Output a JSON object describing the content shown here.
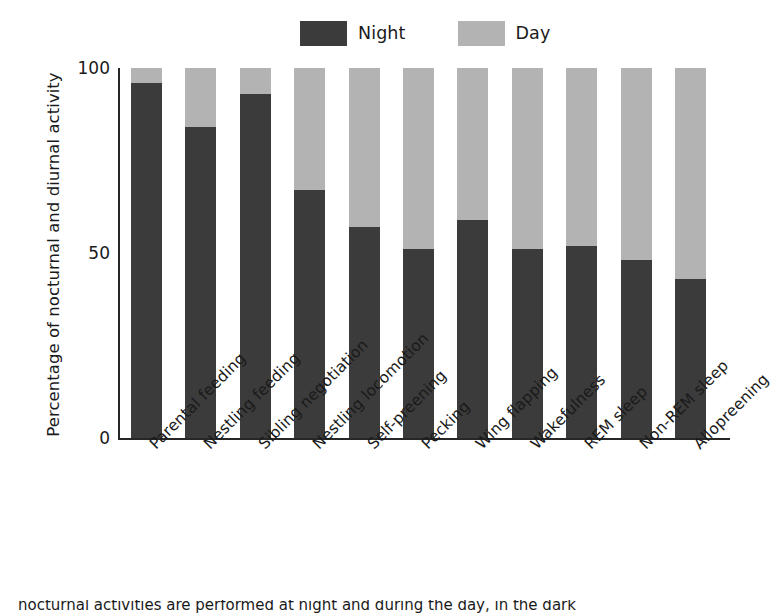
{
  "chart_data": {
    "type": "bar",
    "subtype": "stacked-bar-100-percent",
    "title": "",
    "xlabel": "",
    "ylabel": "Percentage of nocturnal and diurnal activity",
    "ylim": [
      0,
      100
    ],
    "yticks": [
      0,
      50,
      100
    ],
    "ytick_labels": [
      "0",
      "50",
      "100"
    ],
    "grid": false,
    "legend_position": "top-center",
    "categories": [
      "Parental feeding",
      "Nestling feeding",
      "Sibling negotiation",
      "Nestling locomotion",
      "Self-preening",
      "Pecking",
      "Wing flapping",
      "Wakefulness",
      "REM sleep",
      "Non-REM sleep",
      "Allopreening"
    ],
    "series": [
      {
        "name": "Night",
        "color": "#3b3b3b",
        "values": [
          96,
          84,
          93,
          67,
          57,
          51,
          59,
          51,
          52,
          48,
          43
        ]
      },
      {
        "name": "Day",
        "color": "#b3b3b3",
        "values": [
          4,
          16,
          7,
          33,
          43,
          49,
          41,
          49,
          48,
          52,
          57
        ]
      }
    ]
  },
  "legend": {
    "items": [
      {
        "label": "Night",
        "color": "#3b3b3b"
      },
      {
        "label": "Day",
        "color": "#b3b3b3"
      }
    ]
  },
  "axes": {
    "y_title": "Percentage of nocturnal and diurnal activity",
    "y_tick_labels": [
      "100",
      "50",
      "0"
    ]
  },
  "caption": {
    "text": "nocturnal activities are performed at night and during the day, in the dark"
  },
  "colors": {
    "night": "#3b3b3b",
    "day": "#b3b3b3",
    "axis": "#262626",
    "text": "#1a1a1a",
    "background": "#ffffff"
  }
}
